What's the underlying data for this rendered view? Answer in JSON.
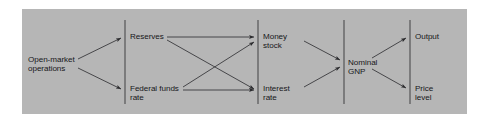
{
  "figure": {
    "type": "flow-diagram",
    "title": "",
    "background_color": "#b6b6b6",
    "page_color": "#ffffff",
    "line_color": "#2a2a2d",
    "text_color": "#17171a"
  },
  "columns": [
    {
      "name": "instruments",
      "nodes": [
        "open-market-operations"
      ]
    },
    {
      "name": "operating-targets",
      "nodes": [
        "reserves",
        "federal-funds-rate"
      ]
    },
    {
      "name": "intermediate-targets",
      "nodes": [
        "money-stock",
        "interest-rate"
      ]
    },
    {
      "name": "nominal-aggregate",
      "nodes": [
        "nominal-gnp"
      ]
    },
    {
      "name": "goals",
      "nodes": [
        "output",
        "price-level"
      ]
    }
  ],
  "nodes": {
    "open_market_operations": "Open-market\noperations",
    "reserves": "Reserves",
    "federal_funds_rate": "Federal funds\nrate",
    "money_stock": "Money\nstock",
    "interest_rate": "Interest\nrate",
    "nominal_gnp": "Nominal\nGNP",
    "output": "Output",
    "price_level": "Price\nlevel"
  },
  "edges": [
    {
      "from": "open-market-operations",
      "to": "reserves"
    },
    {
      "from": "open-market-operations",
      "to": "federal-funds-rate"
    },
    {
      "from": "reserves",
      "to": "money-stock"
    },
    {
      "from": "reserves",
      "to": "interest-rate"
    },
    {
      "from": "federal-funds-rate",
      "to": "money-stock"
    },
    {
      "from": "federal-funds-rate",
      "to": "interest-rate"
    },
    {
      "from": "money-stock",
      "to": "nominal-gnp"
    },
    {
      "from": "interest-rate",
      "to": "nominal-gnp"
    },
    {
      "from": "nominal-gnp",
      "to": "output"
    },
    {
      "from": "nominal-gnp",
      "to": "price-level"
    }
  ],
  "dividers": [
    {
      "name": "divider-1",
      "x": 103
    },
    {
      "name": "divider-2",
      "x": 236
    },
    {
      "name": "divider-3",
      "x": 322
    },
    {
      "name": "divider-4",
      "x": 388
    }
  ]
}
